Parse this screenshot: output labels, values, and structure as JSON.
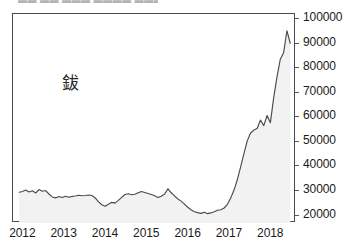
{
  "top_clipped_text": "▬▬ ▬▬ ▬▬▬ ▬▬▬▬ ▬▬▬ ,",
  "chart_data": {
    "type": "area",
    "title": "",
    "subtitle": "",
    "xlabel": "",
    "ylabel": "",
    "annotation": "鈸",
    "annotation_meaning": "cobalt",
    "grid": false,
    "legend_position": "none",
    "y_axis_side": "right",
    "xlim": [
      2011.75,
      2018.6
    ],
    "ylim": [
      17000,
      102000
    ],
    "ytick_labels": [
      "100000",
      "90000",
      "80000",
      "70000",
      "60000",
      "50000",
      "40000",
      "30000",
      "20000"
    ],
    "yticks": [
      100000,
      90000,
      80000,
      70000,
      60000,
      50000,
      40000,
      30000,
      20000
    ],
    "xtick_labels": [
      "2012",
      "2013",
      "2014",
      "2015",
      "2016",
      "2017",
      "2018"
    ],
    "xticks": [
      2012,
      2013,
      2014,
      2015,
      2016,
      2017,
      2018
    ],
    "line_color": "#4a4a4a",
    "fill_color": "#f2f2f2",
    "series": [
      {
        "name": "鈸",
        "x": [
          2011.9,
          2011.98,
          2012.06,
          2012.14,
          2012.22,
          2012.3,
          2012.38,
          2012.46,
          2012.54,
          2012.62,
          2012.7,
          2012.78,
          2012.86,
          2012.94,
          2013.02,
          2013.1,
          2013.18,
          2013.26,
          2013.34,
          2013.42,
          2013.5,
          2013.58,
          2013.66,
          2013.74,
          2013.82,
          2013.9,
          2013.98,
          2014.06,
          2014.14,
          2014.22,
          2014.3,
          2014.38,
          2014.46,
          2014.54,
          2014.62,
          2014.7,
          2014.78,
          2014.86,
          2014.94,
          2015.02,
          2015.1,
          2015.18,
          2015.26,
          2015.34,
          2015.42,
          2015.5,
          2015.58,
          2015.66,
          2015.74,
          2015.82,
          2015.9,
          2015.98,
          2016.06,
          2016.14,
          2016.22,
          2016.3,
          2016.38,
          2016.46,
          2016.54,
          2016.62,
          2016.7,
          2016.78,
          2016.86,
          2016.94,
          2017.02,
          2017.1,
          2017.18,
          2017.26,
          2017.34,
          2017.42,
          2017.5,
          2017.58,
          2017.66,
          2017.74,
          2017.82,
          2017.9,
          2017.98,
          2018.06,
          2018.14,
          2018.22,
          2018.3,
          2018.38,
          2018.46
        ],
        "values": [
          29500,
          29800,
          30400,
          29600,
          30100,
          29200,
          30600,
          29900,
          30200,
          28800,
          27600,
          27200,
          27800,
          27400,
          27900,
          27500,
          27800,
          28000,
          28300,
          28100,
          28200,
          28400,
          28200,
          27200,
          25600,
          24400,
          23800,
          24600,
          25400,
          25100,
          26200,
          27400,
          28600,
          28900,
          28500,
          28700,
          29300,
          29800,
          29400,
          29000,
          28600,
          28100,
          27400,
          27900,
          28800,
          30900,
          29300,
          28000,
          26800,
          25900,
          24700,
          23400,
          22400,
          21600,
          21200,
          20900,
          21400,
          20800,
          21100,
          21600,
          22200,
          22400,
          23100,
          24600,
          27200,
          30400,
          34600,
          39800,
          45200,
          50400,
          53600,
          54800,
          55400,
          58900,
          56600,
          60700,
          57800,
          68000,
          76400,
          83600,
          86200,
          95200,
          90100
        ]
      }
    ],
    "notable_points": {
      "start_value": 29500,
      "start_year": 2012,
      "trough_value": 20800,
      "trough_year": 2016,
      "peak_value": 95200,
      "peak_year": 2018,
      "end_value": 90100
    }
  }
}
